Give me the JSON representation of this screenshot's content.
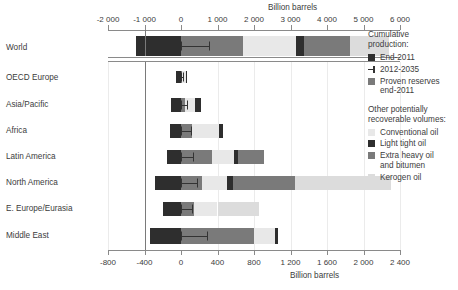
{
  "axes": {
    "top_title": "Billion barrels",
    "bottom_title": "Billion barrels",
    "top_ticks": [
      "-2 000",
      "-1 000",
      "0",
      "1 000",
      "2 000",
      "3 000",
      "4 000",
      "5 000",
      "6 000"
    ],
    "top_tick_values": [
      -2000,
      -1000,
      0,
      1000,
      2000,
      3000,
      4000,
      5000,
      6000
    ],
    "bottom_ticks": [
      "-800",
      "-400",
      "0",
      "400",
      "800",
      "1 200",
      "1 600",
      "2 000",
      "2 400"
    ],
    "bottom_tick_values": [
      -800,
      -400,
      0,
      400,
      800,
      1200,
      1600,
      2000,
      2400
    ]
  },
  "legend": {
    "heading1_line1": "Cumulative",
    "heading1_line2": "production:",
    "item_end2011": "End-2011",
    "item_projection": "2012-2035",
    "item_proven_line1": "Proven reserves",
    "item_proven_line2": "end-2011",
    "heading2_line1": "Other potentially",
    "heading2_line2": "recoverable volumes:",
    "item_conventional": "Conventional oil",
    "item_lighttight": "Light tight oil",
    "item_extraheavy_line1": "Extra heavy oil",
    "item_extraheavy_line2": "and bitumen",
    "item_kerogen": "Kerogen oil"
  },
  "colors": {
    "end2011": "#2e2e2e",
    "proven": "#7a7a7a",
    "conventional": "#e8e8e8",
    "lighttight": "#2e2e2e",
    "extraheavy": "#7a7a7a",
    "kerogen": "#dcdcdc",
    "axis": "#8a8a8a",
    "grid": "#ebebeb",
    "text": "#3c3c3c"
  },
  "chart_data": {
    "type": "bar",
    "title": "",
    "orientation": "horizontal",
    "stacked": true,
    "xlabel": "Billion barrels",
    "ylabel": "",
    "grid": true,
    "legend_position": "right",
    "note": "World row is plotted on the top axis (-2000..6000); the seven regional rows are plotted on the bottom axis (-800..2400). Negative extent is cumulative production End-2011; positive extent stacks proven reserves then other potentially recoverable volumes.",
    "series": [
      {
        "name": "End-2011",
        "key": "end2011"
      },
      {
        "name": "Proven reserves end-2011",
        "key": "proven"
      },
      {
        "name": "Conventional oil",
        "key": "conventional"
      },
      {
        "name": "Light tight oil",
        "key": "lighttight"
      },
      {
        "name": "Extra heavy oil and bitumen",
        "key": "extraheavy"
      },
      {
        "name": "Kerogen oil",
        "key": "kerogen"
      }
    ],
    "categories": [
      "World",
      "OECD Europe",
      "Asia/Pacific",
      "Africa",
      "Latin America",
      "North America",
      "E. Europe/Eurasia",
      "Middle East"
    ],
    "rows": [
      {
        "label": "World",
        "axis": "top",
        "end2011": 1240,
        "proven": 1690,
        "conventional": 1450,
        "lighttight": 240,
        "extraheavy": 1250,
        "kerogen": 1070,
        "projection_2012_2035": 760
      },
      {
        "label": "OECD Europe",
        "axis": "bottom",
        "end2011": 60,
        "proven": 13,
        "conventional": 45,
        "lighttight": 12,
        "extraheavy": 0,
        "kerogen": 0,
        "projection_2012_2035": 18
      },
      {
        "label": "Asia/Pacific",
        "axis": "bottom",
        "end2011": 110,
        "proven": 45,
        "conventional": 105,
        "lighttight": 65,
        "extraheavy": 0,
        "kerogen": 0,
        "projection_2012_2035": 62
      },
      {
        "label": "Africa",
        "axis": "bottom",
        "end2011": 125,
        "proven": 125,
        "conventional": 295,
        "lighttight": 35,
        "extraheavy": 0,
        "kerogen": 0,
        "projection_2012_2035": 115
      },
      {
        "label": "Latin America",
        "axis": "bottom",
        "end2011": 150,
        "proven": 335,
        "conventional": 245,
        "lighttight": 45,
        "extraheavy": 290,
        "kerogen": 0,
        "projection_2012_2035": 135
      },
      {
        "label": "North America",
        "axis": "bottom",
        "end2011": 290,
        "proven": 225,
        "conventional": 280,
        "lighttight": 70,
        "extraheavy": 675,
        "kerogen": 1050,
        "projection_2012_2035": 175
      },
      {
        "label": "E. Europe/Eurasia",
        "axis": "bottom",
        "end2011": 195,
        "proven": 145,
        "conventional": 255,
        "lighttight": 0,
        "extraheavy": 0,
        "kerogen": 460,
        "projection_2012_2035": 120
      },
      {
        "label": "Middle East",
        "axis": "bottom",
        "end2011": 335,
        "proven": 805,
        "conventional": 230,
        "lighttight": 25,
        "extraheavy": 0,
        "kerogen": 0,
        "projection_2012_2035": 290
      }
    ]
  }
}
